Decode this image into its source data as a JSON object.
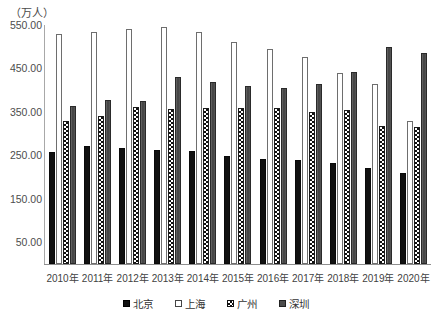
{
  "chart_data": {
    "type": "bar",
    "title": "",
    "subtitle": "",
    "unit_label": "（万人）",
    "xlabel": "",
    "ylabel": "",
    "ylim": [
      0,
      550
    ],
    "yticks": [
      "50.00",
      "150.00",
      "250.00",
      "350.00",
      "450.00",
      "550.00"
    ],
    "ytick_values": [
      50,
      150,
      250,
      350,
      450,
      550
    ],
    "grid": false,
    "legend_position": "bottom",
    "categories": [
      "2010年",
      "2011年",
      "2012年",
      "2013年",
      "2014年",
      "2015年",
      "2016年",
      "2017年",
      "2018年",
      "2019年",
      "2020年"
    ],
    "series": [
      {
        "name": "北京",
        "fill": "solid-black",
        "values": [
          258,
          272,
          266,
          262,
          259,
          248,
          241,
          240,
          232,
          220,
          210
        ]
      },
      {
        "name": "上海",
        "fill": "hollow-white",
        "values": [
          530,
          533,
          540,
          545,
          535,
          512,
          495,
          477,
          440,
          415,
          330
        ]
      },
      {
        "name": "广州",
        "fill": "checkered",
        "values": [
          330,
          340,
          362,
          356,
          360,
          358,
          358,
          350,
          355,
          318,
          315
        ]
      },
      {
        "name": "深圳",
        "fill": "gray-solid",
        "values": [
          363,
          377,
          375,
          430,
          420,
          410,
          405,
          415,
          443,
          500,
          485
        ]
      }
    ]
  },
  "legend": {
    "items": [
      {
        "label": "北京",
        "key": "beijing"
      },
      {
        "label": "上海",
        "key": "shanghai"
      },
      {
        "label": "广州",
        "key": "guangzhou"
      },
      {
        "label": "深圳",
        "key": "shenzhen"
      }
    ]
  }
}
